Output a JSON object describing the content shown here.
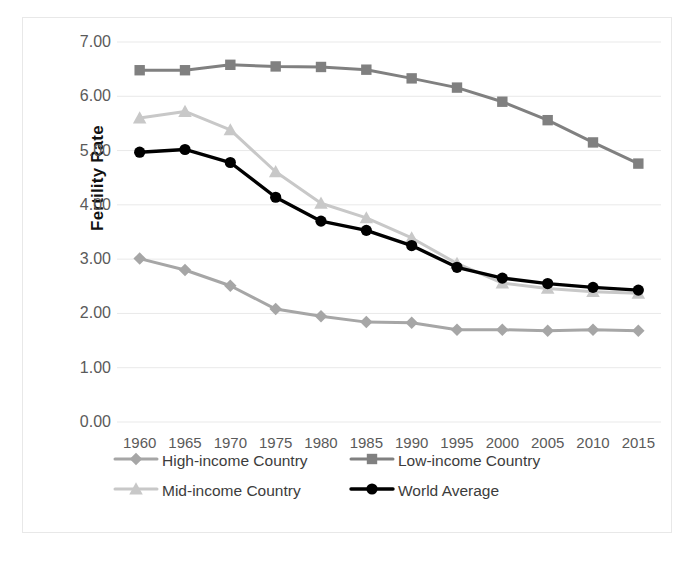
{
  "chart_data": {
    "type": "line",
    "title": "",
    "xlabel": "",
    "ylabel": "Fertility Rate",
    "x": [
      1960,
      1965,
      1970,
      1975,
      1980,
      1985,
      1990,
      1995,
      2000,
      2005,
      2010,
      2015
    ],
    "xtick_labels": [
      "1960",
      "1965",
      "1970",
      "1975",
      "1980",
      "1985",
      "1990",
      "1995",
      "2000",
      "2005",
      "2010",
      "2015"
    ],
    "ytick_labels": [
      "0.00",
      "1.00",
      "2.00",
      "3.00",
      "4.00",
      "5.00",
      "6.00",
      "7.00"
    ],
    "yticks": [
      0,
      1,
      2,
      3,
      4,
      5,
      6,
      7
    ],
    "ylim": [
      0,
      7
    ],
    "grid": true,
    "legend_position": "bottom",
    "series": [
      {
        "name": "High-income Country",
        "marker": "diamond",
        "color": "#a6a6a6",
        "values": [
          3.01,
          2.8,
          2.51,
          2.08,
          1.95,
          1.84,
          1.83,
          1.7,
          1.7,
          1.68,
          1.7,
          1.68
        ]
      },
      {
        "name": "Low-income Country",
        "marker": "square",
        "color": "#808080",
        "values": [
          6.48,
          6.48,
          6.58,
          6.55,
          6.54,
          6.49,
          6.33,
          6.16,
          5.9,
          5.56,
          5.15,
          4.76
        ]
      },
      {
        "name": "Mid-income Country",
        "marker": "triangle",
        "color": "#c8c8c8",
        "values": [
          5.6,
          5.72,
          5.38,
          4.61,
          4.03,
          3.76,
          3.39,
          2.92,
          2.56,
          2.46,
          2.4,
          2.37
        ]
      },
      {
        "name": "World Average",
        "marker": "circle",
        "color": "#000000",
        "values": [
          4.97,
          5.02,
          4.78,
          4.14,
          3.7,
          3.53,
          3.25,
          2.85,
          2.65,
          2.55,
          2.48,
          2.43
        ]
      }
    ]
  },
  "axis": {
    "y_title": "Fertility Rate"
  },
  "legend": {
    "items": [
      {
        "label": "High-income Country"
      },
      {
        "label": "Low-income Country"
      },
      {
        "label": "Mid-income Country"
      },
      {
        "label": "World Average"
      }
    ]
  }
}
